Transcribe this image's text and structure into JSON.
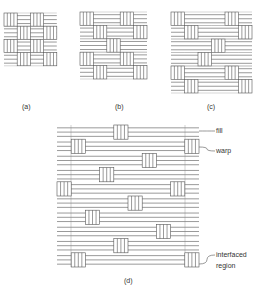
{
  "figure": {
    "panels": [
      {
        "id": "a",
        "caption": "(a)",
        "x": 4,
        "y": 13,
        "cell": 13.2,
        "rows": [
          "VHVH",
          "HVHV",
          "VHVH",
          "HVHV"
        ],
        "caption_x": 22,
        "caption_y": 103
      },
      {
        "id": "b",
        "caption": "(b)",
        "x": 80,
        "y": 12,
        "cell": 13.4,
        "rows": [
          "VHHVH",
          "HVHHV",
          "HHVHH",
          "VHHVH",
          "HVHHV"
        ],
        "caption_x": 115,
        "caption_y": 103
      },
      {
        "id": "c",
        "caption": "(c)",
        "x": 171,
        "y": 12,
        "cell": 13.5,
        "rows": [
          "VHHHVH",
          "HVHHHV",
          "HHHVHH",
          "HHVHHH",
          "VHHHVH",
          "HVHHHV"
        ],
        "caption_x": 207,
        "caption_y": 103
      },
      {
        "id": "d",
        "caption": "(d)",
        "x": 57,
        "y": 125,
        "cell": 14.2,
        "cols": 10,
        "rows": [
          "HHHHVHHHHH",
          "HVHHHHHHHV",
          "HHHHHHVHHH",
          "HHHVHHHHHH",
          "VHHHHHHHVH",
          "HHHHHVHHHH",
          "HHVHHHHHHH",
          "HHHHHHHVHH",
          "HHHHVHHHHH",
          "HVHHHHHHHV"
        ],
        "caption_x": 124,
        "caption_y": 277,
        "region_lines": [
          71,
          185
        ]
      }
    ],
    "callouts": [
      {
        "label": "fill",
        "text_x": 216,
        "text_y": 127,
        "from_x": 199,
        "from_y": 131,
        "to_x": 215,
        "to_y": 131
      },
      {
        "label": "warp",
        "text_x": 216,
        "text_y": 147,
        "from_x": 199,
        "from_y": 147,
        "to_x": 215,
        "to_y": 151
      },
      {
        "label": "interfaced",
        "text_x": 216,
        "text_y": 251,
        "from_x": 199,
        "from_y": 264,
        "to_x": 215,
        "to_y": 255
      },
      {
        "label": "region",
        "text_x": 216,
        "text_y": 262,
        "from_x": null,
        "from_y": null,
        "to_x": null,
        "to_y": null
      }
    ],
    "line_color": "#555555",
    "background": "#ffffff"
  }
}
